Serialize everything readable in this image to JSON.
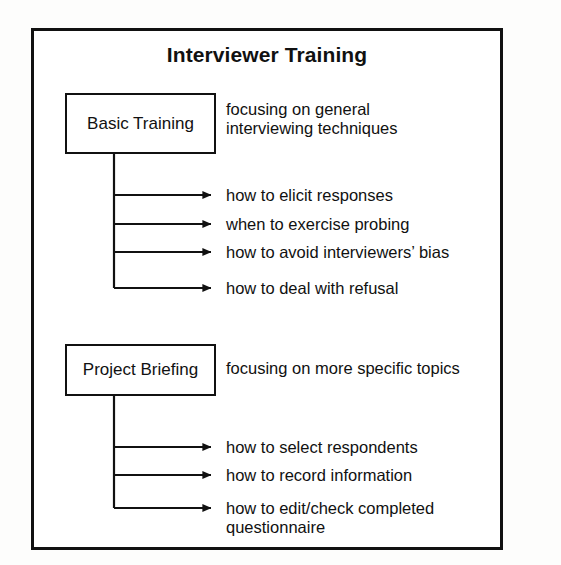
{
  "diagram": {
    "title": "Interviewer Training",
    "frame": {
      "visible": true,
      "border_color": "#111111"
    },
    "groups": [
      {
        "box_label": "Basic Training",
        "caption": "focusing on general\ninterviewing techniques",
        "branches": [
          {
            "label": "how to elicit responses"
          },
          {
            "label": "when to exercise probing"
          },
          {
            "label": "how to avoid interviewers’ bias"
          },
          {
            "label": "how to deal with refusal"
          }
        ]
      },
      {
        "box_label": "Project Briefing",
        "caption": "focusing on more specific topics",
        "branches": [
          {
            "label": "how to select respondents"
          },
          {
            "label": "how to record information"
          },
          {
            "label": "how to edit/check completed\nquestionnaire"
          }
        ]
      }
    ]
  }
}
